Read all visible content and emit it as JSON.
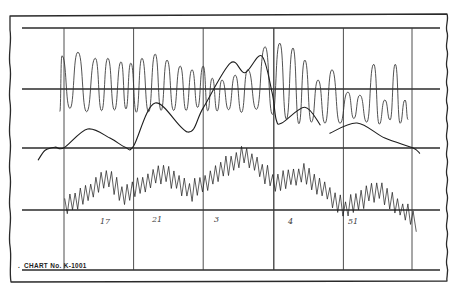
{
  "chart_data": {
    "type": "line",
    "title": "CHART No. K-1001",
    "title_prefix": ".",
    "xlabel": "",
    "ylabel": "",
    "grid": true,
    "legend": "none",
    "xlim": [
      -0.6,
      5.4
    ],
    "ylim": [
      0,
      4
    ],
    "x_gridlines": [
      0,
      1,
      2,
      3,
      4,
      5
    ],
    "y_gridlines": [
      0,
      1,
      2,
      3,
      4
    ],
    "markers": [
      {
        "label": "17",
        "x": 0.56,
        "y": 0.81
      },
      {
        "label": "21",
        "x": 1.32,
        "y": 0.84
      },
      {
        "label": "3",
        "x": 2.18,
        "y": 0.84
      },
      {
        "label": "4",
        "x": 3.28,
        "y": 0.81
      },
      {
        "label": "51",
        "x": 4.14,
        "y": 0.81
      }
    ],
    "series": [
      {
        "name": "upper oscillating trace",
        "style": "loops",
        "start": [
          -0.06,
          2.62
        ],
        "trough_level": [
          [
            -0.1,
            2.64
          ],
          [
            2.95,
            2.64
          ],
          [
            3.05,
            2.47
          ],
          [
            5.0,
            2.45
          ]
        ],
        "peaks": [
          [
            -0.03,
            3.54
          ],
          [
            0.2,
            3.6
          ],
          [
            0.45,
            3.5
          ],
          [
            0.63,
            3.5
          ],
          [
            0.82,
            3.44
          ],
          [
            0.96,
            3.42
          ],
          [
            1.12,
            3.5
          ],
          [
            1.31,
            3.57
          ],
          [
            1.48,
            3.47
          ],
          [
            1.67,
            3.37
          ],
          [
            1.84,
            3.31
          ],
          [
            2.0,
            3.37
          ],
          [
            2.13,
            3.17
          ],
          [
            2.27,
            3.14
          ],
          [
            2.46,
            3.22
          ],
          [
            2.64,
            3.31
          ],
          [
            2.89,
            3.69
          ],
          [
            3.1,
            3.75
          ],
          [
            3.29,
            3.67
          ],
          [
            3.46,
            3.47
          ],
          [
            3.65,
            3.14
          ],
          [
            3.85,
            3.31
          ],
          [
            4.08,
            2.94
          ],
          [
            4.25,
            2.89
          ],
          [
            4.45,
            3.4
          ],
          [
            4.61,
            2.81
          ],
          [
            4.76,
            3.4
          ],
          [
            4.9,
            2.81
          ]
        ]
      },
      {
        "name": "middle smooth trace",
        "style": "smooth",
        "segments": [
          [
            [
              -0.37,
              1.82
            ],
            [
              -0.27,
              1.98
            ],
            [
              -0.13,
              2.03
            ],
            [
              0.0,
              2.02
            ],
            [
              0.34,
              2.33
            ],
            [
              0.66,
              2.18
            ],
            [
              0.88,
              2.03
            ],
            [
              1.0,
              2.05
            ],
            [
              1.31,
              2.76
            ],
            [
              1.78,
              2.28
            ],
            [
              2.0,
              2.68
            ],
            [
              2.39,
              3.42
            ],
            [
              2.6,
              3.26
            ],
            [
              2.84,
              3.54
            ],
            [
              2.99,
              2.93
            ],
            [
              3.05,
              2.48
            ],
            [
              3.13,
              2.43
            ],
            [
              3.46,
              2.69
            ],
            [
              3.68,
              2.4
            ]
          ],
          [
            [
              3.82,
              2.26
            ],
            [
              4.21,
              2.43
            ],
            [
              4.61,
              2.18
            ],
            [
              5.01,
              2.02
            ],
            [
              5.11,
              1.93
            ]
          ]
        ]
      },
      {
        "name": "lower zigzag trace",
        "style": "zigzag",
        "amplitude": 0.14,
        "points": [
          [
            0.01,
            1.07
          ],
          [
            0.23,
            1.19
          ],
          [
            0.62,
            1.52
          ],
          [
            0.88,
            1.22
          ],
          [
            1.42,
            1.62
          ],
          [
            1.81,
            1.29
          ],
          [
            2.17,
            1.57
          ],
          [
            2.57,
            1.92
          ],
          [
            3.03,
            1.44
          ],
          [
            3.46,
            1.59
          ],
          [
            4.04,
            1.02
          ],
          [
            4.5,
            1.32
          ],
          [
            5.04,
            0.83
          ]
        ]
      }
    ]
  }
}
